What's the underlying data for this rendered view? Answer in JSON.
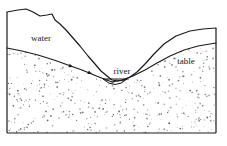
{
  "figure": {
    "type": "geological-cross-section",
    "width": 227,
    "height": 146,
    "background_color": "#ffffff",
    "line_color": "#1a1a1a",
    "stipple_color": "#555555"
  },
  "labels": {
    "water": "water",
    "table": "table",
    "river": "river"
  },
  "frame": {
    "left_x": 7,
    "right_x": 216,
    "bottom_y": 133,
    "left_top_y": 12,
    "right_top_y": 28,
    "stroke_width": 1.2
  },
  "ground_surface": {
    "description": "jagged upper terrain profile descending from left into valley then rising to right",
    "points": "7,12 18,10 26,9 33,12 40,16 47,15 52,14 55,20 60,24 66,30 73,38 80,46 88,56 95,64 101,71 107,76 112,80 118,81 124,80 130,77 137,72 145,64 154,54 164,44 176,36 190,31 203,29 216,28"
  },
  "water_table": {
    "description": "water table line sloping down toward river from both sides",
    "left_points": "7,48 22,51 38,55 54,60 68,65 82,70 94,75 104,79 112,82",
    "right_points": "112,82 122,80 133,76 145,70 157,63 170,56 184,50 198,46 216,43",
    "arrows": [
      {
        "x": 73,
        "y": 67,
        "angle": 20,
        "name": "flow-arrow-left-1"
      },
      {
        "x": 92,
        "y": 74,
        "angle": 24,
        "name": "flow-arrow-left-2"
      }
    ]
  },
  "river_channel": {
    "description": "hatched river cross-section at valley bottom",
    "top_left_x": 103,
    "top_right_x": 127,
    "top_y": 79,
    "bottom_y": 88,
    "hatch_angle": 45,
    "hatch_spacing": 2.4
  },
  "label_positions": {
    "water": {
      "x": 41,
      "y": 39
    },
    "table": {
      "x": 186,
      "y": 62
    },
    "river": {
      "x": 122,
      "y": 72
    }
  },
  "stipple": {
    "description": "random speckled dots representing permeable sediment / aquifer material below the water table",
    "count": 560,
    "dot_min_radius": 0.35,
    "dot_max_radius": 0.95,
    "seed": 20240517
  }
}
